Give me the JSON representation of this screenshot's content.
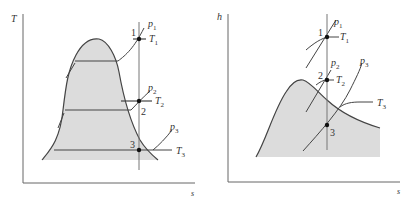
{
  "diagrams": [
    {
      "name": "T-s diagram",
      "y_axis_label": "T",
      "x_axis_label": "s",
      "states": [
        "1",
        "2",
        "3"
      ],
      "isobars": [
        {
          "p": "p",
          "sub": "1"
        },
        {
          "p": "p",
          "sub": "2"
        },
        {
          "p": "p",
          "sub": "3"
        }
      ],
      "isotherms": [
        {
          "t": "T",
          "sub": "1"
        },
        {
          "t": "T",
          "sub": "2"
        },
        {
          "t": "T",
          "sub": "3"
        }
      ]
    },
    {
      "name": "h-s diagram",
      "y_axis_label": "h",
      "x_axis_label": "s",
      "states": [
        "1",
        "2",
        "3"
      ],
      "isobars": [
        {
          "p": "p",
          "sub": "1"
        },
        {
          "p": "p",
          "sub": "2"
        },
        {
          "p": "p",
          "sub": "3"
        }
      ],
      "isotherms": [
        {
          "t": "T",
          "sub": "1"
        },
        {
          "t": "T",
          "sub": "2"
        },
        {
          "t": "T",
          "sub": "3"
        }
      ]
    }
  ],
  "colors": {
    "dome_fill": "#dcdcdc",
    "line": "#444444",
    "axis": "#666666",
    "point": "#111111"
  }
}
